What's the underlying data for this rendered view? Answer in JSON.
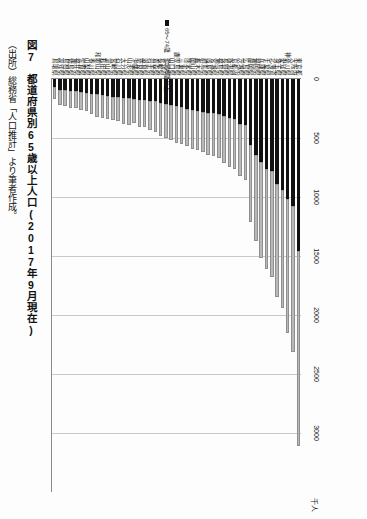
{
  "figure": {
    "caption": "図7　都道府県別65歳以上人口(2017年9月現在)",
    "source": "（出所）総務省「人口推計」より筆者作成。"
  },
  "chart_data": {
    "type": "bar",
    "orientation": "horizontal-stacked",
    "title": "図7　都道府県別65歳以上人口(2017年9月現在)",
    "xlabel": "",
    "ylabel": "",
    "unit_label": "千人",
    "xlim": [
      0,
      3500
    ],
    "xticks": [
      0,
      500,
      1000,
      1500,
      2000,
      2500,
      3000
    ],
    "xticklabels": [
      "0",
      "500",
      "1000",
      "1500",
      "2000",
      "2500",
      "3000"
    ],
    "grid": true,
    "legend_position": "left-middle",
    "legend": [
      "65〜74歳",
      "75歳以上"
    ],
    "series": [
      {
        "name": "65〜74歳",
        "color": "#111111"
      },
      {
        "name": "75歳以上",
        "color": "#b9b9b9"
      }
    ],
    "categories": [
      "東京都",
      "大阪府",
      "神奈川県",
      "愛知県",
      "埼玉県",
      "北海道",
      "千葉県",
      "兵庫県",
      "福岡県",
      "静岡県",
      "広島県",
      "茨城県",
      "京都府",
      "新潟県",
      "長野県",
      "福島県",
      "宮城県",
      "岐阜県",
      "群馬県",
      "栃木県",
      "岡山県",
      "熊本県",
      "三重県",
      "鹿児島県",
      "山口県",
      "愛媛県",
      "長崎県",
      "青森県",
      "岩手県",
      "滋賀県",
      "奈良県",
      "沖縄県",
      "山形県",
      "大分県",
      "石川県",
      "宮崎県",
      "富山県",
      "秋田県",
      "和歌山県",
      "香川県",
      "山梨県",
      "佐賀県",
      "福井県",
      "徳島県",
      "島根県",
      "高知県",
      "鳥取県"
    ],
    "values_65_74": [
      1460,
      1080,
      1020,
      940,
      890,
      780,
      760,
      700,
      640,
      560,
      390,
      380,
      340,
      330,
      310,
      300,
      290,
      290,
      280,
      270,
      260,
      250,
      240,
      230,
      220,
      210,
      200,
      190,
      185,
      180,
      175,
      170,
      165,
      160,
      155,
      150,
      140,
      135,
      130,
      125,
      115,
      110,
      105,
      100,
      95,
      90,
      70
    ],
    "values_75_plus": [
      1650,
      1230,
      1130,
      1000,
      960,
      900,
      850,
      820,
      730,
      650,
      470,
      440,
      420,
      420,
      400,
      370,
      360,
      350,
      340,
      330,
      330,
      320,
      310,
      310,
      300,
      290,
      280,
      260,
      250,
      230,
      230,
      200,
      225,
      220,
      205,
      200,
      195,
      195,
      190,
      175,
      160,
      155,
      145,
      145,
      135,
      130,
      100
    ]
  }
}
